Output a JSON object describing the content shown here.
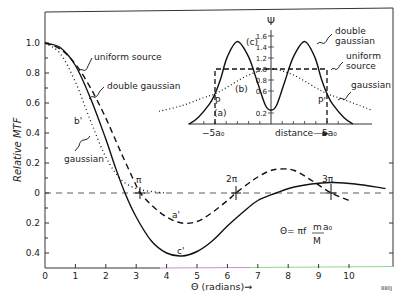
{
  "chart_data": [
    {
      "type": "line",
      "title": "",
      "xlabel": "Θ (radians)→",
      "ylabel": "Relative MTF",
      "xlim": [
        0,
        11.6
      ],
      "ylim": [
        -0.5,
        1.15
      ],
      "grid": false,
      "x_ticks": [
        0,
        1,
        2,
        3,
        4,
        5,
        6,
        7,
        8,
        9,
        10
      ],
      "x_tick_labels": [
        "0",
        "1",
        "2",
        "3",
        "4",
        "5",
        "6",
        "7",
        "8",
        "9",
        "10"
      ],
      "y_ticks": [
        1.0,
        0.8,
        0.6,
        0.4,
        0.2,
        0,
        -0.2,
        -0.4
      ],
      "y_tick_labels": [
        "1.0",
        "0.8",
        "0.6",
        "0.4",
        "0.2",
        "0",
        "0.2",
        "0.4"
      ],
      "zero_line": "dashed",
      "series": [
        {
          "name": "uniform source",
          "curve_label": "a'",
          "style": "dashed",
          "x": [
            0,
            0.5,
            1.0,
            1.5,
            2.0,
            2.5,
            3.0,
            3.14,
            3.5,
            4.0,
            4.5,
            5.0,
            5.5,
            6.0,
            6.28,
            6.8,
            7.3,
            7.7,
            8.2,
            8.8,
            9.42,
            10.0
          ],
          "values": [
            1.0,
            0.96,
            0.86,
            0.7,
            0.5,
            0.27,
            0.05,
            0.0,
            -0.08,
            -0.16,
            -0.2,
            -0.19,
            -0.13,
            -0.05,
            0.0,
            0.08,
            0.14,
            0.16,
            0.15,
            0.08,
            0.0,
            -0.05
          ]
        },
        {
          "name": "double gaussian",
          "curve_label": "c'",
          "style": "solid",
          "x": [
            0,
            0.5,
            1.0,
            1.5,
            2.0,
            2.3,
            2.63,
            3.0,
            3.5,
            4.0,
            4.5,
            5.0,
            5.5,
            6.0,
            6.5,
            7.0,
            7.6,
            8.2,
            9.0,
            9.5,
            10.2,
            11.2
          ],
          "values": [
            1.0,
            0.97,
            0.85,
            0.63,
            0.36,
            0.18,
            0.0,
            -0.16,
            -0.32,
            -0.4,
            -0.42,
            -0.39,
            -0.32,
            -0.22,
            -0.13,
            -0.05,
            0.0,
            0.04,
            0.065,
            0.07,
            0.06,
            0.03
          ]
        },
        {
          "name": "gaussian",
          "curve_label": "b'",
          "style": "dotted",
          "x": [
            0,
            0.5,
            1.0,
            1.5,
            2.0,
            2.5,
            3.0,
            3.5,
            4.0
          ],
          "values": [
            1.0,
            0.93,
            0.74,
            0.48,
            0.24,
            0.09,
            0.03,
            0.01,
            0.0
          ]
        }
      ],
      "annotations": [
        "uniform source",
        "double gaussian",
        "gaussian",
        "b'",
        "a'",
        "c'",
        "π",
        "2π",
        "3π",
        "Θ = πf (m/M) a₀"
      ],
      "markers": [
        {
          "label": "π",
          "x": 3.14,
          "y": 0
        },
        {
          "label": "2π",
          "x": 6.28,
          "y": 0
        },
        {
          "label": "3π",
          "x": 9.42,
          "y": 0
        }
      ]
    },
    {
      "type": "line",
      "title": "inset: source distributions",
      "xlabel": "distance→",
      "ylabel": "Ψ",
      "x_tick_labels_shown": [
        "-5a₀",
        "5a₀"
      ],
      "y_ticks": [
        0.2,
        0.6,
        0.8,
        1.0,
        1.2,
        1.4,
        1.6
      ],
      "y_tick_labels": [
        "0.2",
        "0.6",
        "0.8",
        "1.0",
        "1.2",
        "1.4",
        "1.6"
      ],
      "series": [
        {
          "name": "double gaussian",
          "curve_label": "(c)",
          "style": "solid",
          "x": [
            -7.3,
            -6.5,
            -5.5,
            -5.0,
            -4.5,
            -3.9,
            -3.0,
            -2.0,
            -1.2,
            -0.5,
            0,
            0.5,
            1.2,
            2.0,
            3.0,
            3.9,
            4.5,
            5.0,
            5.5,
            6.5,
            7.3
          ],
          "values": [
            0.0,
            0.12,
            0.36,
            0.55,
            0.82,
            1.22,
            1.5,
            1.22,
            0.75,
            0.34,
            0.25,
            0.34,
            0.75,
            1.22,
            1.5,
            1.22,
            0.82,
            0.55,
            0.36,
            0.12,
            0.0
          ]
        },
        {
          "name": "uniform source",
          "curve_label": "(a)",
          "style": "dashed",
          "x": [
            -5.0,
            -5.0,
            5.0,
            5.0
          ],
          "values": [
            0.0,
            1.0,
            1.0,
            0.0
          ]
        },
        {
          "name": "gaussian",
          "curve_label": "(b)",
          "style": "dotted",
          "x": [
            -10,
            -8,
            -6,
            -5,
            -4,
            -2,
            0,
            2,
            4,
            5,
            6,
            8,
            9
          ],
          "values": [
            0.23,
            0.33,
            0.48,
            0.55,
            0.66,
            0.89,
            1.0,
            0.89,
            0.66,
            0.55,
            0.48,
            0.33,
            0.25
          ]
        }
      ],
      "points": [
        {
          "label": "P",
          "x": -5.0,
          "y": 0.55
        },
        {
          "label": "P'",
          "x": 5.0,
          "y": 0.55
        }
      ]
    }
  ],
  "labels": {
    "ylabel": "Relative MTF",
    "xlabel": "Θ (radians)→",
    "uniform_source": "uniform source",
    "double_gaussian": "double gaussian",
    "gaussian": "gaussian",
    "b_prime": "b'",
    "a_prime": "a'",
    "c_prime": "c'",
    "pi": "π",
    "two_pi": "2π",
    "three_pi": "3π",
    "formula_left": "Θ= πf",
    "formula_num": "m",
    "formula_a0": "a₀",
    "formula_den": "M",
    "figure_id": "880J",
    "inset": {
      "psi": "Ψ",
      "double": "double",
      "gaussian_word": "gaussian",
      "uniform": "uniform",
      "source": "source",
      "gaussian": "gaussian",
      "c": "(c)",
      "b": "(b)",
      "a": "(a)",
      "P": "P",
      "P_prime": "P'",
      "minus5a0": "−5a₀",
      "plus5a0": "5a₀",
      "distance": "distance—►"
    }
  }
}
